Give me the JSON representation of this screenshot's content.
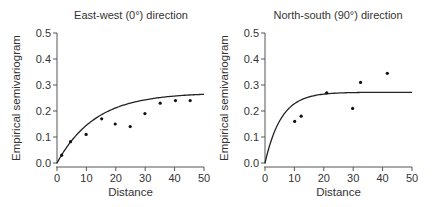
{
  "chart_data": [
    {
      "type": "scatter",
      "title": "East-west (0°) direction",
      "xlabel": "Distance",
      "ylabel": "Empirical semivariogram",
      "xlim": [
        0,
        50
      ],
      "ylim": [
        0,
        0.5
      ],
      "xticks": [
        "0",
        "10",
        "20",
        "30",
        "40",
        "50"
      ],
      "yticks": [
        "0.0",
        "0.1",
        "0.2",
        "0.3",
        "0.4",
        "0.5"
      ],
      "grid": false,
      "points": [
        {
          "x": 1.6,
          "y": 0.03
        },
        {
          "x": 4.6,
          "y": 0.082
        },
        {
          "x": 9.9,
          "y": 0.11
        },
        {
          "x": 15.2,
          "y": 0.17
        },
        {
          "x": 19.8,
          "y": 0.15
        },
        {
          "x": 24.9,
          "y": 0.14
        },
        {
          "x": 29.9,
          "y": 0.19
        },
        {
          "x": 35.1,
          "y": 0.23
        },
        {
          "x": 40.3,
          "y": 0.24
        },
        {
          "x": 45.3,
          "y": 0.24
        }
      ],
      "fitted_model": {
        "name": "exponential",
        "nugget": 0.0,
        "sill": 0.27,
        "range_param": 13.0
      }
    },
    {
      "type": "scatter",
      "title": "North-south (90°) direction",
      "xlabel": "Distance",
      "ylabel": "Empirical semivariogram",
      "xlim": [
        0,
        50
      ],
      "ylim": [
        0,
        0.5
      ],
      "xticks": [
        "0",
        "10",
        "20",
        "30",
        "40",
        "50"
      ],
      "yticks": [
        "0.0",
        "0.1",
        "0.2",
        "0.3",
        "0.4",
        "0.5"
      ],
      "grid": false,
      "points": [
        {
          "x": 10.1,
          "y": 0.16
        },
        {
          "x": 12.3,
          "y": 0.18
        },
        {
          "x": 21.0,
          "y": 0.27
        },
        {
          "x": 29.8,
          "y": 0.21
        },
        {
          "x": 32.5,
          "y": 0.31
        },
        {
          "x": 41.6,
          "y": 0.345
        }
      ],
      "fitted_model": {
        "name": "exponential",
        "nugget": 0.0,
        "sill": 0.272,
        "range_param": 5.5
      }
    }
  ]
}
